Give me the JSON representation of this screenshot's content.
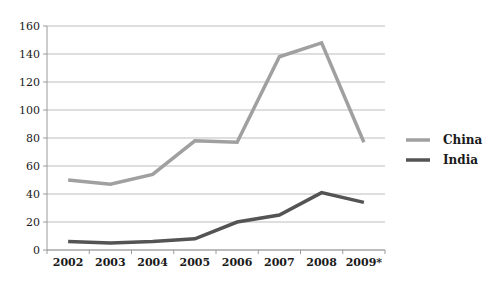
{
  "chart_data": {
    "type": "line",
    "categories": [
      "2002",
      "2003",
      "2004",
      "2005",
      "2006",
      "2007",
      "2008",
      "2009*"
    ],
    "series": [
      {
        "name": "China",
        "color": "#a0a0a0",
        "values": [
          50,
          47,
          54,
          78,
          77,
          138,
          148,
          77
        ]
      },
      {
        "name": "India",
        "color": "#545454",
        "values": [
          6,
          5,
          6,
          8,
          20,
          25,
          41,
          34
        ]
      }
    ],
    "title": "",
    "xlabel": "",
    "ylabel": "",
    "ylim": [
      0,
      160
    ],
    "ytick_step": 20,
    "ytick_labels": [
      "0",
      "20",
      "40",
      "60",
      "80",
      "100",
      "120",
      "140",
      "160"
    ],
    "grid": "horizontal",
    "legend_position": "right-middle",
    "colors": {
      "gridline": "#bdbdbd",
      "axis": "#9a9a9a",
      "text": "#1a1a1a",
      "background": "#ffffff"
    }
  }
}
